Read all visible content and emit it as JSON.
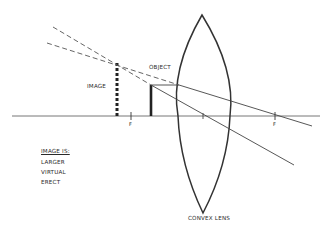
{
  "diagram": {
    "colors": {
      "background": "#ffffff",
      "line": "#333333",
      "text": "#2a2a2a"
    },
    "labels": {
      "image": "IMAGE",
      "object": "OBJECT",
      "focal_left": "F",
      "focal_right": "F",
      "lens": "CONVEX LENS"
    },
    "properties": {
      "heading": "IMAGE IS:",
      "items": [
        "LARGER",
        "VIRTUAL",
        "ERECT"
      ]
    }
  }
}
